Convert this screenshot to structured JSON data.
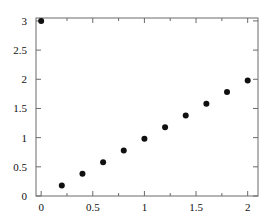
{
  "chart_data": {
    "type": "scatter",
    "title": "",
    "xlabel": "",
    "ylabel": "",
    "xlim": [
      -0.05,
      2.1
    ],
    "ylim": [
      0,
      3.05
    ],
    "grid": false,
    "legend": null,
    "marker": {
      "shape": "circle",
      "color": "#101010",
      "size_px": 4
    },
    "frame_color": "#6a6a6a",
    "x": [
      0,
      0.2,
      0.4,
      0.6,
      0.8,
      1.0,
      1.2,
      1.4,
      1.6,
      1.8,
      2.0
    ],
    "values": [
      3.0,
      0.18,
      0.38,
      0.58,
      0.78,
      0.98,
      1.18,
      1.38,
      1.58,
      1.78,
      1.98
    ],
    "series": [
      {
        "name": "data",
        "points": [
          {
            "x": 0,
            "y": 3.0
          },
          {
            "x": 0.2,
            "y": 0.18
          },
          {
            "x": 0.4,
            "y": 0.38
          },
          {
            "x": 0.6,
            "y": 0.58
          },
          {
            "x": 0.8,
            "y": 0.78
          },
          {
            "x": 1.0,
            "y": 0.98
          },
          {
            "x": 1.2,
            "y": 1.18
          },
          {
            "x": 1.4,
            "y": 1.38
          },
          {
            "x": 1.6,
            "y": 1.58
          },
          {
            "x": 1.8,
            "y": 1.78
          },
          {
            "x": 2.0,
            "y": 1.98
          }
        ]
      }
    ],
    "xticks": [
      {
        "value": 0,
        "label": "0"
      },
      {
        "value": 0.5,
        "label": "0.5"
      },
      {
        "value": 1.0,
        "label": "1"
      },
      {
        "value": 1.5,
        "label": "1.5"
      },
      {
        "value": 2.0,
        "label": "2"
      }
    ],
    "yticks": [
      {
        "value": 0,
        "label": "0"
      },
      {
        "value": 0.5,
        "label": "0.5"
      },
      {
        "value": 1.0,
        "label": "1"
      },
      {
        "value": 1.5,
        "label": "1.5"
      },
      {
        "value": 2.0,
        "label": "2"
      },
      {
        "value": 2.5,
        "label": "2.5"
      },
      {
        "value": 3.0,
        "label": "3"
      }
    ],
    "xminor_ticks": [
      0.25,
      0.75,
      1.25,
      1.75
    ],
    "plot_box_px": {
      "left": 36,
      "right": 258,
      "top": 18,
      "bottom": 196
    }
  }
}
